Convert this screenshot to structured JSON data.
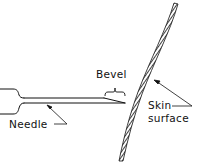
{
  "diagram": {
    "type": "line-art illustration",
    "labels": {
      "bevel": "Bevel",
      "needle": "Needle",
      "skin_line1": "Skin",
      "skin_line2": "surface"
    },
    "colors": {
      "ink": "#111111",
      "background": "#ffffff"
    }
  }
}
